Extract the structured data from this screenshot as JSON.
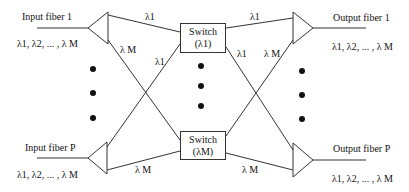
{
  "diagram": {
    "type": "wavelength-routing switch architecture",
    "inputs": [
      {
        "label": "Input fiber 1",
        "wavelengths": "λ1, λ2, ... , λ M"
      },
      {
        "label": "Input fiber P",
        "wavelengths": "λ1, λ2, ... , λ M"
      }
    ],
    "outputs": [
      {
        "label": "Output fiber 1",
        "wavelengths": "λ1, λ2, ... , λ M"
      },
      {
        "label": "Output fiber P",
        "wavelengths": "λ1, λ2, ... , λ M"
      }
    ],
    "switches": [
      {
        "line1": "Switch",
        "line2": "(λ1)"
      },
      {
        "line1": "Switch",
        "line2": "(λM)"
      }
    ],
    "edge_labels": {
      "in1_to_sw1": "λ1",
      "in1_to_swM": "λ M",
      "inP_to_sw1": "λ1",
      "inP_to_swM": "λ M",
      "sw1_to_out1": "λ1",
      "sw1_to_outP": "λ1",
      "swM_to_out1": "λ M",
      "swM_to_outP": "λ M"
    },
    "colors": {
      "line": "#333333",
      "text": "#111111",
      "background": "#ffffff"
    }
  }
}
